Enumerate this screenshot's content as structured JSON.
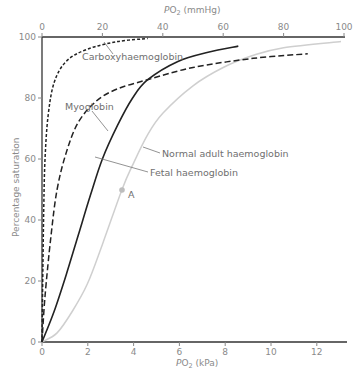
{
  "chart_data": {
    "type": "line",
    "title": "",
    "xlabel": "PO2 (kPa)",
    "x2label": "PO2 (mmHg)",
    "ylabel": "Percentage saturation",
    "xlim_kpa": [
      0,
      13.2
    ],
    "xlim_mmhg": [
      0,
      100
    ],
    "ylim": [
      0,
      100
    ],
    "x_ticks_kpa": [
      "0",
      "2",
      "4",
      "6",
      "8",
      "10",
      "12"
    ],
    "x_ticks_mmhg": [
      "0",
      "20",
      "40",
      "60",
      "80",
      "100"
    ],
    "y_ticks": [
      "0",
      "20",
      "40",
      "60",
      "80",
      "100"
    ],
    "grid": false,
    "legend": "inline labels",
    "x_unit_of_points": "mmHg",
    "series": [
      {
        "name": "Carboxyhaemoglobin",
        "style": "dotted",
        "color": "#222222",
        "points": [
          [
            0,
            0
          ],
          [
            0.3,
            25
          ],
          [
            0.6,
            45
          ],
          [
            1,
            60
          ],
          [
            2,
            74
          ],
          [
            4,
            85
          ],
          [
            8,
            92
          ],
          [
            15,
            96
          ],
          [
            25,
            98.5
          ],
          [
            35,
            99.5
          ]
        ]
      },
      {
        "name": "Myoglobin",
        "style": "dashed",
        "color": "#222222",
        "points": [
          [
            0,
            0
          ],
          [
            1,
            15
          ],
          [
            3,
            35
          ],
          [
            5,
            50
          ],
          [
            8,
            62
          ],
          [
            12,
            72
          ],
          [
            18,
            79
          ],
          [
            25,
            83
          ],
          [
            35,
            86
          ],
          [
            50,
            90
          ],
          [
            70,
            93
          ],
          [
            88,
            94.5
          ]
        ]
      },
      {
        "name": "Fetal haemoglobin",
        "style": "solid",
        "color": "#222222",
        "points": [
          [
            0,
            0
          ],
          [
            4,
            10
          ],
          [
            8,
            22
          ],
          [
            12,
            35
          ],
          [
            16,
            48
          ],
          [
            20,
            60
          ],
          [
            25,
            71
          ],
          [
            30,
            80
          ],
          [
            35,
            86
          ],
          [
            45,
            92
          ],
          [
            55,
            95
          ],
          [
            65,
            97
          ]
        ]
      },
      {
        "name": "Normal adult haemoglobin",
        "style": "solid",
        "color": "#cfcfcf",
        "points": [
          [
            0,
            0
          ],
          [
            5,
            3
          ],
          [
            10,
            10
          ],
          [
            15,
            19
          ],
          [
            20,
            32
          ],
          [
            26.5,
            50
          ],
          [
            30,
            58
          ],
          [
            35,
            68
          ],
          [
            40,
            75
          ],
          [
            50,
            84
          ],
          [
            60,
            90
          ],
          [
            70,
            94
          ],
          [
            80,
            96.5
          ],
          [
            99,
            98.5
          ]
        ]
      }
    ],
    "annotations": [
      {
        "label": "A",
        "x_mmhg": 26.5,
        "y": 50,
        "note": "P50 of normal adult haemoglobin"
      }
    ]
  },
  "labels": {
    "top_axis_title_main": "P",
    "top_axis_title_sub": "O",
    "top_axis_title_subscript": "2",
    "top_axis_title_unit": " (mmHg)",
    "bottom_axis_title_main": "P",
    "bottom_axis_title_sub": "O",
    "bottom_axis_title_subscript": "2",
    "bottom_axis_title_unit": " (kPa)",
    "y_axis_title": "Percentage saturation",
    "carboxy": "Carboxyhaemoglobin",
    "myoglobin": "Myoglobin",
    "normal": "Normal adult haemoglobin",
    "fetal": "Fetal haemoglobin",
    "point_a": "A"
  }
}
